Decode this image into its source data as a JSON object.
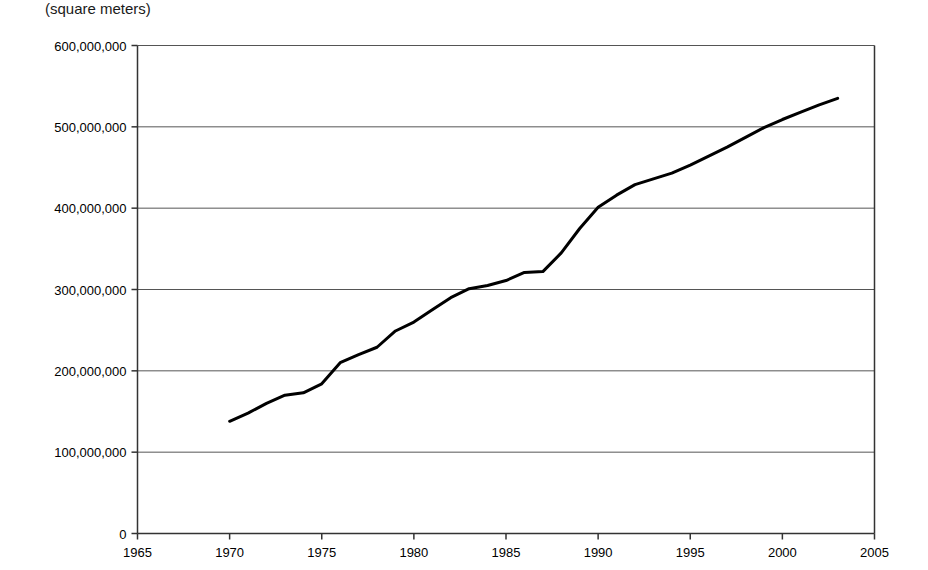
{
  "chart_data": {
    "type": "line",
    "title": "",
    "subtitle": "",
    "unit_label": "(square meters)",
    "xlabel": "",
    "ylabel": "",
    "xlim": [
      1965,
      2005
    ],
    "ylim": [
      0,
      600000000
    ],
    "grid": true,
    "grid_axis": "y",
    "legend": false,
    "legend_position": "none",
    "xticks": [
      1965,
      1970,
      1975,
      1980,
      1985,
      1990,
      1995,
      2000,
      2005
    ],
    "xtick_labels": [
      "1965",
      "1970",
      "1975",
      "1980",
      "1985",
      "1990",
      "1995",
      "2000",
      "2005"
    ],
    "yticks": [
      0,
      100000000,
      200000000,
      300000000,
      400000000,
      500000000,
      600000000
    ],
    "ytick_labels": [
      "0",
      "100,000,000",
      "200,000,000",
      "300,000,000",
      "400,000,000",
      "500,000,000",
      "600,000,000"
    ],
    "line_color": "#000000",
    "line_width": 3,
    "series": [
      {
        "name": "floor area",
        "x": [
          1970,
          1971,
          1972,
          1973,
          1974,
          1975,
          1976,
          1977,
          1978,
          1979,
          1980,
          1981,
          1982,
          1983,
          1984,
          1985,
          1986,
          1987,
          1988,
          1989,
          1990,
          1991,
          1992,
          1993,
          1994,
          1995,
          1996,
          1997,
          1998,
          1999,
          2000,
          2001,
          2002,
          2003
        ],
        "values": [
          138000000,
          148000000,
          160000000,
          170000000,
          173000000,
          184000000,
          210000000,
          220000000,
          229000000,
          249000000,
          260000000,
          275000000,
          290000000,
          301000000,
          305000000,
          311000000,
          321000000,
          322000000,
          345000000,
          375000000,
          401000000,
          416000000,
          429000000,
          436000000,
          443000000,
          453000000,
          464000000,
          475000000,
          487000000,
          499000000,
          509000000,
          518000000,
          527000000,
          535000000
        ]
      }
    ]
  }
}
